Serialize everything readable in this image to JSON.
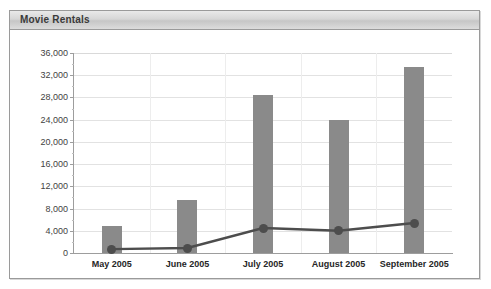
{
  "panel": {
    "title": "Movie Rentals"
  },
  "chart_data": {
    "type": "bar",
    "title": "Movie Rentals",
    "xlabel": "",
    "ylabel": "",
    "grid": true,
    "legend": "none",
    "ylim": [
      0,
      36000
    ],
    "ytick_step": 4000,
    "categories": [
      "May 2005",
      "June 2005",
      "July 2005",
      "August 2005",
      "September 2005"
    ],
    "ytick_labels": [
      "0",
      "4,000",
      "8,000",
      "12,000",
      "16,000",
      "20,000",
      "24,000",
      "28,000",
      "32,000",
      "36,000"
    ],
    "ytick_values": [
      0,
      4000,
      8000,
      12000,
      16000,
      20000,
      24000,
      28000,
      32000,
      36000
    ],
    "series": [
      {
        "name": "Rentals",
        "type": "bar",
        "color": "#8a8a8a",
        "values": [
          4900,
          9500,
          28400,
          24000,
          33500
        ]
      },
      {
        "name": "Trend",
        "type": "line",
        "color": "#4d4d4d",
        "values": [
          700,
          900,
          4500,
          4000,
          5400
        ]
      }
    ]
  }
}
